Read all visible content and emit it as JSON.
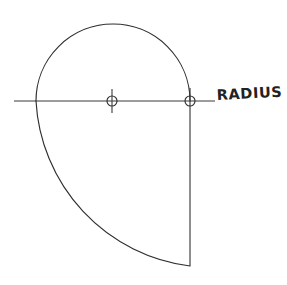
{
  "diagram": {
    "background_color": "#ffffff",
    "line_color": "#2e2e2e",
    "axis_color": "#3a3a3a",
    "label_color": "#222222",
    "style": "hand-drawn technical sketch",
    "canvas": {
      "width": 287,
      "height": 285
    },
    "labels": {
      "radius": "RADIUS"
    },
    "geometry": {
      "axis_line": {
        "name": "horizontal-centerline",
        "x1": 14,
        "y1": 101,
        "x2": 215,
        "y2": 101
      },
      "vertical_line": {
        "name": "vertical-radius-line",
        "x1": 190,
        "y1": 88,
        "x2": 190,
        "y2": 266
      },
      "center_mark": {
        "name": "center-point",
        "cx": 112,
        "cy": 101,
        "r": 5,
        "tick_top": 89,
        "tick_bottom": 113
      },
      "tangent_point": {
        "name": "tangent-point",
        "cx": 190,
        "cy": 101,
        "r": 5
      },
      "upper_arc": {
        "name": "upper-semicircle",
        "start_x": 36,
        "start_y": 101,
        "end_x": 190,
        "end_y": 101,
        "radius": 77,
        "apex_x": 113,
        "apex_y": 20,
        "sweep": 1,
        "large_arc": 0
      },
      "lower_arc": {
        "name": "lower-sweep-arc",
        "start_x": 36,
        "start_y": 101,
        "end_x": 190,
        "end_y": 266,
        "radius": 176,
        "sweep": 0,
        "large_arc": 0
      },
      "radius_label": {
        "name": "radius-label",
        "x": 217,
        "y": 100
      }
    }
  }
}
